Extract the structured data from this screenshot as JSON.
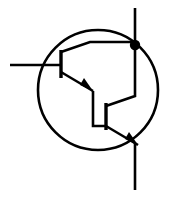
{
  "figure": {
    "type": "schematic-symbol",
    "background_color": "#ffffff",
    "line_color": "#000000",
    "canvas": {
      "width": 176,
      "height": 197
    }
  },
  "geometry": {
    "envelope": {
      "label": "transistor package envelope",
      "cx": 98,
      "cy": 90,
      "r": 60,
      "stroke_width": 2.6
    },
    "node": {
      "label": "collector junction dot",
      "cx": 135,
      "cy": 45,
      "r": 5.2
    },
    "leads": {
      "base_lead": {
        "label": "base terminal lead",
        "x1": 10,
        "y1": 65,
        "x2": 61,
        "y2": 65,
        "stroke_width": 2.6
      },
      "collector_lead": {
        "label": "collector terminal lead",
        "x1": 135,
        "y1": 8,
        "x2": 135,
        "y2": 45,
        "stroke_width": 2.6
      },
      "emitter_lead": {
        "label": "emitter terminal lead",
        "x1": 135,
        "y1": 143,
        "x2": 135,
        "y2": 190,
        "stroke_width": 2.6
      }
    },
    "q1": {
      "label": "input transistor Q1",
      "base_bar": {
        "x": 61,
        "y1": 50,
        "y2": 78,
        "stroke_width": 3.4
      },
      "collector_branch": "61,52 90,42 135,42",
      "emitter_branch": "61,72 93,91",
      "emitter_arrow": {
        "points": "93,91 80,85 84,78",
        "tip_x": 93,
        "tip_y": 91
      }
    },
    "q2": {
      "label": "output transistor Q2",
      "base_bar": {
        "x": 106,
        "y1": 103,
        "y2": 130,
        "stroke_width": 3.4
      },
      "collector_branch": "106,106 135,96 135,45",
      "emitter_branch": "106,126 138,145",
      "emitter_arrow": {
        "points": "138,145 125,139 129,132",
        "tip_x": 138,
        "tip_y": 145
      }
    },
    "interconnect": {
      "label": "Q1 emitter to Q2 base interconnect",
      "path": "93,91 93,126 106,126",
      "stroke_width": 2.6
    }
  },
  "terminals": [
    {
      "name": "base",
      "side": "left"
    },
    {
      "name": "collector",
      "side": "top"
    },
    {
      "name": "emitter",
      "side": "bottom"
    }
  ],
  "labels": {
    "visible_text": []
  }
}
